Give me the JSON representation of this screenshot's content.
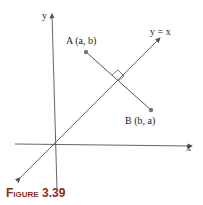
{
  "figure": {
    "caption_word": "Figure",
    "caption_number": "3.39",
    "caption_color": "#8b2a1e"
  },
  "labels": {
    "y_axis": "y",
    "x_axis": "x",
    "line": "y = x",
    "point_a": "A (a, b)",
    "point_b": "B (b, a)"
  }
}
